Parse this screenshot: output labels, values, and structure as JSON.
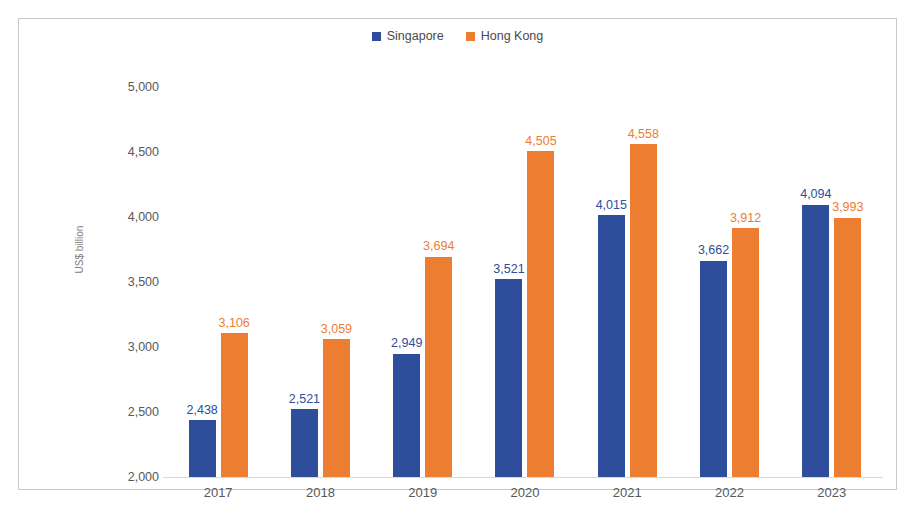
{
  "chart_data": {
    "type": "bar",
    "title": "",
    "subtitle": "",
    "xlabel": "",
    "ylabel": "US$ billion",
    "categories": [
      "2017",
      "2018",
      "2019",
      "2020",
      "2021",
      "2022",
      "2023"
    ],
    "series": [
      {
        "name": "Singapore",
        "color": "#2E4D9B",
        "values": [
          2438,
          2521,
          2949,
          3521,
          4015,
          3662,
          4094
        ],
        "labels": [
          "2,438",
          "2,521",
          "2,949",
          "3,521",
          "4,015",
          "3,662",
          "4,094"
        ]
      },
      {
        "name": "Hong Kong",
        "color": "#ED7D31",
        "values": [
          3106,
          3059,
          3694,
          4505,
          4558,
          3912,
          3993
        ],
        "labels": [
          "3,106",
          "3,059",
          "3,694",
          "4,505",
          "4,558",
          "3,912",
          "3,993"
        ]
      }
    ],
    "ylim": [
      2000,
      5000
    ],
    "yticks": [
      5000,
      4500,
      4000,
      3500,
      3000,
      2500,
      2000
    ],
    "ytick_labels": [
      "5,000",
      "4,500",
      "4,000",
      "3,500",
      "3,000",
      "2,500",
      "2,000"
    ],
    "grid": false,
    "legend_position": "top-center"
  },
  "legend": {
    "entries": [
      {
        "label": "Singapore",
        "color": "#2E4D9B"
      },
      {
        "label": "Hong Kong",
        "color": "#ED7D31"
      }
    ]
  },
  "axis": {
    "y_title": "US$ billion"
  }
}
